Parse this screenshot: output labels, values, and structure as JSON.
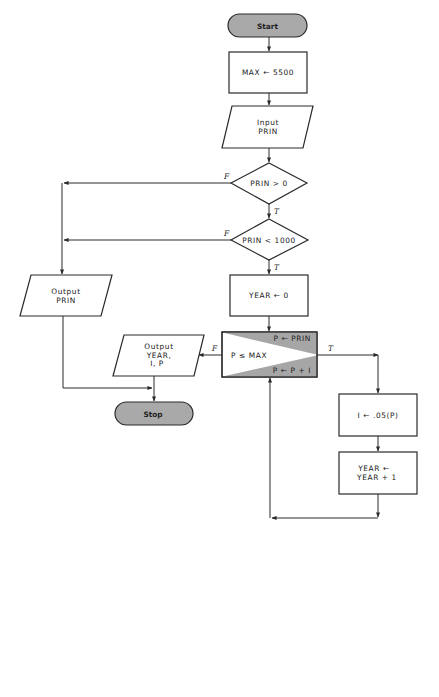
{
  "flowchart": {
    "start": {
      "label": "Start"
    },
    "init_max": {
      "label": "MAX ← 5500"
    },
    "input": {
      "line1": "Input",
      "line2": "PRIN"
    },
    "decision_positive": {
      "label": "PRIN > 0",
      "false_label": "F",
      "true_label": "T"
    },
    "decision_limit": {
      "label": "PRIN < 1000",
      "false_label": "F",
      "true_label": "T"
    },
    "output_prin": {
      "line1": "Output",
      "line2": "PRIN"
    },
    "init_year": {
      "label": "YEAR ← 0"
    },
    "loop": {
      "init": "P ← PRIN",
      "condition": "P ≤ MAX",
      "increment": "P ← P + I",
      "false_label": "F",
      "true_label": "T"
    },
    "output_results": {
      "line1": "Output",
      "line2": "YEAR,",
      "line3": "I, P"
    },
    "stop": {
      "label": "Stop"
    },
    "calc_interest": {
      "label": "I ← .05(P)"
    },
    "increment_year": {
      "line1": "YEAR ←",
      "line2": "YEAR + 1"
    }
  },
  "colors": {
    "terminal_fill": "#a9a9a9",
    "loop_shade": "#a6a6a6",
    "stroke": "#2a2a2a",
    "background": "#ffffff"
  }
}
